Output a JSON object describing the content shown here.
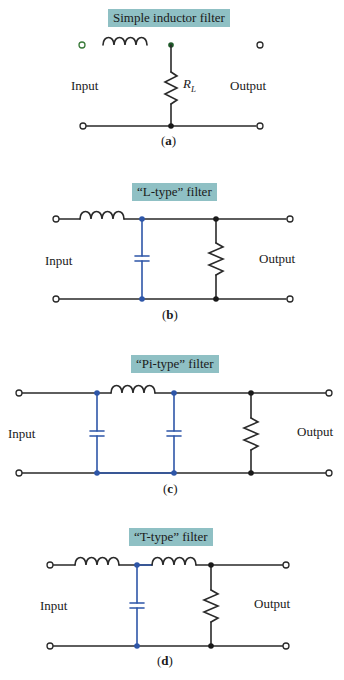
{
  "colors": {
    "wire": "#2a2a2a",
    "capacitor_branch": "#2e56a8",
    "title_box": "#8fc0c4",
    "input_highlight": "#d2477a",
    "output_highlight": "#7fd67f"
  },
  "diagrams": [
    {
      "id": "a",
      "title": "Simple inductor filter",
      "input_label": "Input",
      "output_label": "Output",
      "load_label": "R",
      "load_sub": "L",
      "caption_open": "(",
      "caption_letter": "a",
      "caption_close": ")",
      "components": [
        "inductor (series)",
        "resistor R_L (shunt)"
      ]
    },
    {
      "id": "b",
      "title": "“L-type” filter",
      "input_label": "Input",
      "output_label": "Output",
      "caption_open": "(",
      "caption_letter": "b",
      "caption_close": ")",
      "components": [
        "inductor (series)",
        "capacitor (shunt)",
        "resistor (shunt load)"
      ]
    },
    {
      "id": "c",
      "title": "“Pi-type” filter",
      "input_label": "Input",
      "output_label": "Output",
      "caption_open": "(",
      "caption_letter": "c",
      "caption_close": ")",
      "components": [
        "capacitor (shunt)",
        "inductor (series)",
        "capacitor (shunt)",
        "resistor (shunt load)"
      ]
    },
    {
      "id": "d",
      "title": "“T-type” filter",
      "input_label": "Input",
      "output_label": "Output",
      "caption_open": "(",
      "caption_letter": "d",
      "caption_close": ")",
      "components": [
        "inductor (series)",
        "capacitor (shunt)",
        "inductor (series)",
        "resistor (shunt load)"
      ]
    }
  ]
}
